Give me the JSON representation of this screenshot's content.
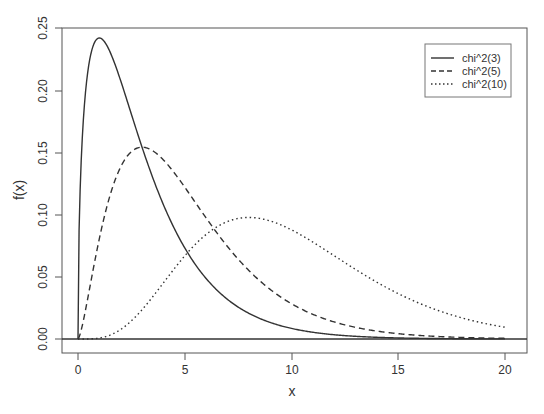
{
  "chart_data": {
    "type": "line",
    "title": "",
    "xlabel": "x",
    "ylabel": "f(x)",
    "xlim": [
      0,
      20
    ],
    "ylim": [
      0,
      0.25
    ],
    "x_ticks": [
      "0",
      "5",
      "10",
      "15",
      "20"
    ],
    "y_ticks": [
      "0.00",
      "0.05",
      "0.10",
      "0.15",
      "0.20",
      "0.25"
    ],
    "grid": false,
    "legend_position": "top-right",
    "series": [
      {
        "name": "chi^2(3)",
        "df": 3,
        "line_style": "solid",
        "x": [
          0,
          0.5,
          1,
          1.5,
          2,
          3,
          4,
          5,
          6,
          8,
          10,
          15,
          20
        ],
        "values": [
          0,
          0.2197,
          0.242,
          0.2308,
          0.2076,
          0.1542,
          0.108,
          0.0732,
          0.0483,
          0.0203,
          0.0085,
          0.001,
          0.0001
        ]
      },
      {
        "name": "chi^2(5)",
        "df": 5,
        "line_style": "dashed",
        "x": [
          0,
          1,
          2,
          3,
          4,
          5,
          6,
          8,
          10,
          15,
          20
        ],
        "values": [
          0,
          0.0807,
          0.1383,
          0.1542,
          0.144,
          0.122,
          0.0965,
          0.054,
          0.0278,
          0.0042,
          0.0005
        ]
      },
      {
        "name": "chi^2(10)",
        "df": 10,
        "line_style": "dotted",
        "x": [
          0,
          2,
          4,
          6,
          8,
          10,
          12,
          14,
          16,
          18,
          20
        ],
        "values": [
          0,
          0.0077,
          0.0451,
          0.084,
          0.0977,
          0.0877,
          0.067,
          0.0457,
          0.0286,
          0.0167,
          0.0092
        ]
      }
    ]
  },
  "axes": {
    "xlabel": "x",
    "ylabel": "f(x)",
    "x_ticks": [
      "0",
      "5",
      "10",
      "15",
      "20"
    ],
    "y_ticks": [
      "0.00",
      "0.05",
      "0.10",
      "0.15",
      "0.20",
      "0.25"
    ]
  },
  "legend": {
    "items": [
      {
        "label": "chi^2(3)"
      },
      {
        "label": "chi^2(5)"
      },
      {
        "label": "chi^2(10)"
      }
    ]
  }
}
